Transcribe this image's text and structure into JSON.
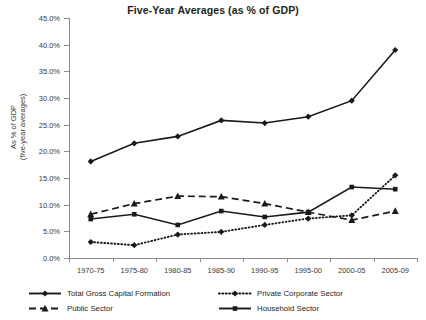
{
  "chart_data": {
    "type": "line",
    "title": "Five-Year Averages (as % of GDP)",
    "xlabel": "",
    "ylabel": "As % of GDP (five-year averages)",
    "ylabel_lines": [
      "As % of GDP",
      "(five-year averages)"
    ],
    "categories": [
      "1970-75",
      "1975-80",
      "1980-85",
      "1985-90",
      "1990-95",
      "1995-00",
      "2000-05",
      "2005-09"
    ],
    "ylim": [
      0,
      45
    ],
    "ytick_step": 5,
    "ytick_labels": [
      "0.0%",
      "5.0%",
      "10.0%",
      "15.0%",
      "20.0%",
      "25.0%",
      "30.0%",
      "35.0%",
      "40.0%",
      "45.0%"
    ],
    "ytick_values": [
      0,
      5,
      10,
      15,
      20,
      25,
      30,
      35,
      40,
      45
    ],
    "grid": false,
    "legend_position": "bottom",
    "units": "percent",
    "series": [
      {
        "name": "Total Gross Capital Formation",
        "marker": "diamond",
        "line_style": "solid",
        "color": "#1a1a1a",
        "values": [
          18.1,
          21.5,
          22.8,
          25.8,
          25.3,
          26.5,
          29.5,
          39.0
        ]
      },
      {
        "name": "Private Corporate Sector",
        "marker": "diamond",
        "line_style": "dotted",
        "color": "#1a1a1a",
        "values": [
          3.0,
          2.4,
          4.4,
          4.9,
          6.2,
          7.4,
          8.0,
          15.5
        ]
      },
      {
        "name": "Public Sector",
        "marker": "triangle",
        "line_style": "dashed",
        "color": "#1a1a1a",
        "values": [
          8.2,
          10.2,
          11.6,
          11.5,
          10.2,
          8.6,
          7.1,
          8.8
        ]
      },
      {
        "name": "Household Sector",
        "marker": "square",
        "line_style": "solid",
        "color": "#1a1a1a",
        "values": [
          7.3,
          8.2,
          6.2,
          8.8,
          7.7,
          8.6,
          13.3,
          12.9
        ]
      }
    ]
  }
}
